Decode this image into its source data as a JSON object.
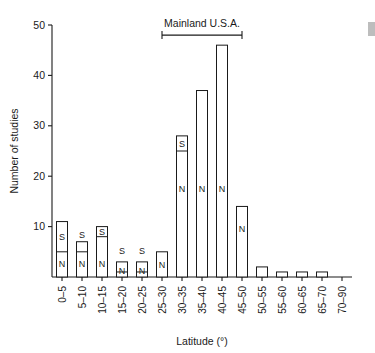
{
  "chart_data": {
    "type": "bar",
    "title": "",
    "xlabel": "Latitude (°)",
    "ylabel": "Number of studies",
    "ylim": [
      0,
      50
    ],
    "yticks": [
      10,
      20,
      30,
      40,
      50
    ],
    "ytick_labels": [
      "10",
      "20",
      "30",
      "40",
      "50"
    ],
    "grid": false,
    "legend": "none",
    "stacked": true,
    "segment_names": [
      "N",
      "S"
    ],
    "categories": [
      "0–5",
      "5–10",
      "10–15",
      "15–20",
      "20–25",
      "25–30",
      "30–35",
      "35–40",
      "40–45",
      "45–50",
      "50–55",
      "55–60",
      "60–65",
      "65–70",
      "70–90"
    ],
    "values": [
      11,
      7,
      10,
      3,
      3,
      5,
      28,
      37,
      46,
      14,
      2,
      1,
      1,
      1,
      0
    ],
    "series": [
      {
        "name": "N",
        "label": "N",
        "values": [
          5,
          5,
          8,
          1,
          1,
          5,
          25,
          37,
          46,
          14,
          2,
          1,
          1,
          1,
          0
        ]
      },
      {
        "name": "S",
        "label": "S",
        "values": [
          6,
          2,
          2,
          2,
          2,
          0,
          3,
          0,
          0,
          0,
          0,
          0,
          0,
          0,
          0
        ]
      }
    ],
    "segment_text_labels": [
      {
        "category": "0–5",
        "text": "S",
        "value": 8
      },
      {
        "category": "0–5",
        "text": "N",
        "value": 2.5
      },
      {
        "category": "5–10",
        "text": "S",
        "value": 8.3
      },
      {
        "category": "5–10",
        "text": "N",
        "value": 2.5
      },
      {
        "category": "10–15",
        "text": "S",
        "value": 9
      },
      {
        "category": "10–15",
        "text": "N",
        "value": 2.5
      },
      {
        "category": "15–20",
        "text": "S",
        "value": 5.2
      },
      {
        "category": "15–20",
        "text": "N",
        "value": 1.2
      },
      {
        "category": "20–25",
        "text": "S",
        "value": 5.2
      },
      {
        "category": "20–25",
        "text": "N",
        "value": 1.2
      },
      {
        "category": "25–30",
        "text": "N",
        "value": 2.3
      },
      {
        "category": "30–35",
        "text": "S",
        "value": 26.4
      },
      {
        "category": "30–35",
        "text": "N",
        "value": 17.5
      },
      {
        "category": "35–40",
        "text": "N",
        "value": 17.5
      },
      {
        "category": "40–45",
        "text": "N",
        "value": 17.5
      },
      {
        "category": "45–50",
        "text": "N",
        "value": 9.5
      }
    ],
    "annotations": [
      {
        "name": "mainland-usa-range",
        "label": "Mainland U.S.A.",
        "from_category": "25–30",
        "to_category": "45–50",
        "at_value": 48
      }
    ]
  }
}
